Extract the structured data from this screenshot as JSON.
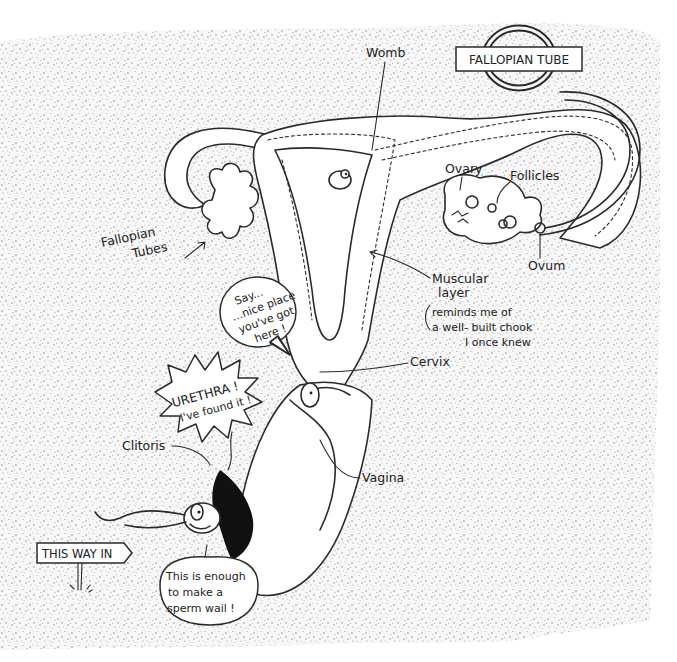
{
  "diagram": {
    "type": "cartoon anatomical diagram",
    "colors": {
      "background": "#ffffff",
      "stipple": "#9a9a9a",
      "ink": "#2a2a2a",
      "fill_black": "#111111"
    },
    "sign": {
      "label": "FALLOPIAN TUBE"
    },
    "labels": {
      "womb": "Womb",
      "fallopian_tubes_line1": "Fallopian",
      "fallopian_tubes_line2": "Tubes",
      "ovary": "Ovary",
      "follicles": "Follicles",
      "ovum": "Ovum",
      "muscular_line1": "Muscular",
      "muscular_line2": "layer",
      "muscular_aside_line1": "reminds me of",
      "muscular_aside_line2": "a well- built chook",
      "muscular_aside_line3": "I once knew",
      "cervix": "Cervix",
      "vagina": "Vagina",
      "clitoris": "Clitoris"
    },
    "speech_bubbles": {
      "nice_place": [
        "Say...",
        "...nice place",
        "you've got",
        "here !"
      ],
      "urethra": [
        "URETHRA !",
        "I've found it !"
      ],
      "sperm_wail": [
        "This is enough",
        "to make a",
        "sperm wail !"
      ]
    },
    "signpost": {
      "label": "THIS WAY IN"
    }
  }
}
